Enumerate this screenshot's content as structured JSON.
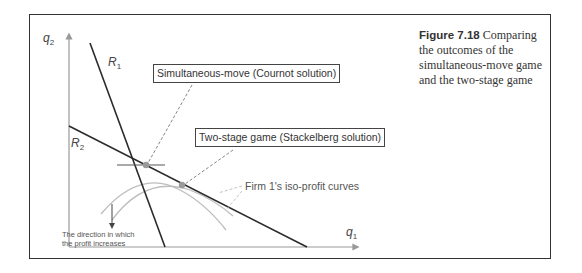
{
  "caption": {
    "figure_number": "Figure 7.18",
    "text": "Comparing the outcomes of the simultaneous-move game and the two-stage game"
  },
  "axes": {
    "y_label": "q",
    "y_sub": "2",
    "x_label": "q",
    "x_sub": "1"
  },
  "curves": {
    "r1_label": "R",
    "r1_sub": "1",
    "r2_label": "R",
    "r2_sub": "2"
  },
  "annotations": {
    "cournot": "Simultaneous-move (Cournot solution)",
    "stackelberg": "Two-stage game (Stackelberg solution)",
    "isoprofit": "Firm 1's iso-profit curves",
    "direction_line1": "The direction in which",
    "direction_line2": "the profit increases"
  },
  "colors": {
    "line": "#2b2b2b",
    "axis": "#999999",
    "curve": "#b5b5b5",
    "point": "#9a9a9a",
    "leader": "#777777"
  }
}
